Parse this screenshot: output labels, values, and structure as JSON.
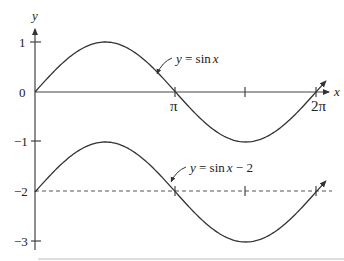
{
  "chart_data": {
    "type": "line",
    "title": "",
    "xlabel": "x",
    "ylabel": "y",
    "xlim": [
      0,
      6.5
    ],
    "ylim": [
      -3.2,
      1.3
    ],
    "grid": false,
    "legend": "none (inline annotations with arrows)",
    "x_ticks": [
      {
        "value": 3.14159,
        "label": "π"
      },
      {
        "value": 4.71239,
        "label": ""
      },
      {
        "value": 6.28319,
        "label": "2π"
      }
    ],
    "y_ticks": [
      {
        "value": 1,
        "label": "1"
      },
      {
        "value": 0,
        "label": "0"
      },
      {
        "value": -1,
        "label": "−1"
      },
      {
        "value": -2,
        "label": "−2"
      },
      {
        "value": -3,
        "label": "−3"
      }
    ],
    "series": [
      {
        "name": "y = sin x",
        "function": "sin(x)",
        "offset": 0,
        "x": [
          0,
          0.7854,
          1.5708,
          2.3562,
          3.1416,
          3.927,
          4.7124,
          5.4978,
          6.2832
        ],
        "values": [
          0,
          0.707,
          1,
          0.707,
          0,
          -0.707,
          -1,
          -0.707,
          0
        ],
        "style": "solid"
      },
      {
        "name": "y = sin x − 2",
        "function": "sin(x) - 2",
        "offset": -2,
        "x": [
          0,
          0.7854,
          1.5708,
          2.3562,
          3.1416,
          3.927,
          4.7124,
          5.4978,
          6.2832
        ],
        "values": [
          -2,
          -1.293,
          -1,
          -1.293,
          -2,
          -2.707,
          -3,
          -2.707,
          -2
        ],
        "style": "solid"
      }
    ],
    "reference_lines": [
      {
        "type": "horizontal",
        "y": -2,
        "style": "dashed"
      }
    ],
    "annotations": [
      {
        "text_parts": [
          "y",
          " = sin",
          "x"
        ],
        "points_to_series": "y = sin x"
      },
      {
        "text_parts": [
          "y",
          " = sin",
          "x",
          " − 2"
        ],
        "points_to_series": "y = sin x − 2"
      }
    ]
  },
  "axes": {
    "x_label": "x",
    "y_label": "y"
  },
  "ticks": {
    "pi": "π",
    "two_pi": "2π",
    "y1": "1",
    "y0": "0",
    "ym1": "−1",
    "ym2": "−2",
    "ym3": "−3"
  },
  "annotations": {
    "sin": {
      "var_y": "y",
      "mid": " = sin",
      "var_x": "x",
      "tail": ""
    },
    "sin_minus_2": {
      "var_y": "y",
      "mid": " = sin",
      "var_x": "x",
      "tail": " − 2"
    }
  },
  "colors": {
    "curve": "#333333",
    "axis": "#444444",
    "text": "#222222"
  }
}
